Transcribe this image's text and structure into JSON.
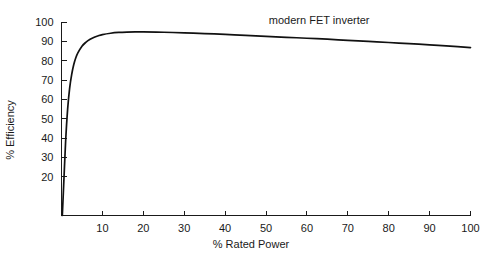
{
  "chart_data": {
    "type": "line",
    "title": "",
    "xlabel": "% Rated Power",
    "ylabel": "% Efficiency",
    "xlim": [
      0,
      100
    ],
    "ylim": [
      0,
      100
    ],
    "grid": false,
    "legend_position": "inline-annotation",
    "xticks": [
      10,
      20,
      30,
      40,
      50,
      60,
      70,
      80,
      90,
      100
    ],
    "xtick_labels": [
      "10",
      "20",
      "30",
      "40",
      "50",
      "60",
      "70",
      "80",
      "90",
      "100"
    ],
    "yticks": [
      20,
      30,
      40,
      50,
      60,
      70,
      80,
      90,
      100
    ],
    "ytick_labels": [
      "20",
      "30",
      "40",
      "50",
      "60",
      "70",
      "80",
      "90",
      "100"
    ],
    "annotations": [
      {
        "text": "modern FET inverter",
        "x": 63,
        "y": 99
      }
    ],
    "series": [
      {
        "name": "modern FET inverter",
        "color": "#111111",
        "x": [
          0.2,
          0.6,
          1.0,
          1.5,
          2.0,
          2.5,
          3.0,
          3.5,
          4.0,
          5.0,
          6.0,
          7.0,
          8.0,
          9.0,
          10.0,
          12.0,
          14.0,
          16.0,
          18.0,
          20.0,
          25.0,
          30.0,
          35.0,
          40.0,
          45.0,
          50.0,
          55.0,
          60.0,
          65.0,
          70.0,
          75.0,
          80.0,
          85.0,
          90.0,
          95.0,
          100.0
        ],
        "y": [
          0,
          19,
          38,
          55,
          66,
          73,
          78,
          81.5,
          84,
          87.5,
          89.6,
          91.1,
          92.1,
          92.9,
          93.5,
          94.2,
          94.6,
          94.8,
          94.9,
          94.9,
          94.7,
          94.4,
          94.0,
          93.6,
          93.1,
          92.6,
          92.1,
          91.6,
          91.1,
          90.5,
          90.0,
          89.4,
          88.8,
          88.2,
          87.5,
          86.8
        ]
      }
    ]
  }
}
